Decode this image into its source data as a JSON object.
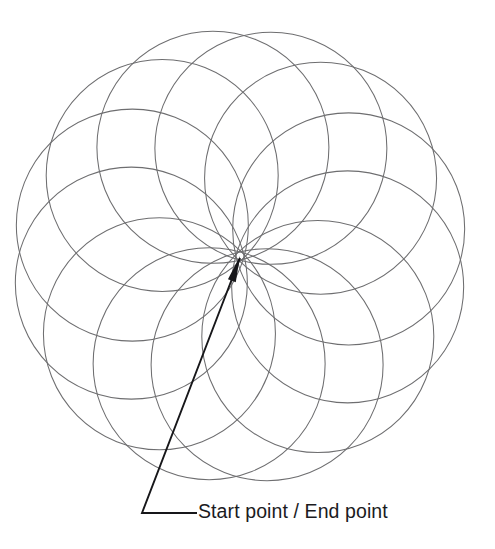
{
  "figure": {
    "background_color": "#ffffff",
    "width": 495,
    "height": 549
  },
  "annotation": {
    "label": "Start point / End point",
    "text_color": "#1b1b1e",
    "text_x": 198,
    "text_y": 513,
    "leader_color": "#17171a",
    "leader_points": "240,258 142,513 197,513",
    "arrow_tip_x": 240,
    "arrow_tip_y": 256
  },
  "chart_data": {
    "type": "scatter",
    "xlabel": "",
    "ylabel": "",
    "xlim": [
      0,
      495
    ],
    "ylim": [
      0,
      549
    ],
    "grid": false,
    "legend": "none",
    "common_point": {
      "x": 240,
      "y": 256,
      "label": "Start point / End point"
    },
    "circle_radius": 116,
    "center_orbit_radius": 112,
    "circle_count": 12,
    "start_angle_deg": -104,
    "angle_step_deg": 30,
    "stroke_color": "#6e6e70",
    "stroke_width": 1.05,
    "circles": [
      {
        "cx": 213.0,
        "cy": 147.3,
        "r": 116
      },
      {
        "cx": 252.0,
        "cy": 148.3,
        "r": 116
      },
      {
        "cx": 288.1,
        "cy": 163.0,
        "r": 116
      },
      {
        "cx": 317.6,
        "cy": 190.1,
        "r": 116
      },
      {
        "cx": 337.8,
        "cy": 226.0,
        "r": 116
      },
      {
        "cx": 346.8,
        "cy": 266.7,
        "r": 116
      },
      {
        "cx": 344.0,
        "cy": 308.2,
        "r": 116
      },
      {
        "cx": 329.7,
        "cy": 345.5,
        "r": 116
      },
      {
        "cx": 305.6,
        "cy": 375.2,
        "r": 116
      },
      {
        "cx": 274.6,
        "cy": 394.4,
        "r": 116
      },
      {
        "cx": 239.9,
        "cy": 401.4,
        "r": 116
      },
      {
        "cx": 205.3,
        "cy": 396.2,
        "r": 116
      },
      {
        "cx": 174.8,
        "cy": 379.0,
        "r": 116
      },
      {
        "cx": 151.4,
        "cy": 351.6,
        "r": 116
      },
      {
        "cx": 137.3,
        "cy": 316.7,
        "r": 116
      },
      {
        "cx": 134.0,
        "cy": 278.3,
        "r": 116
      },
      {
        "cx": 141.9,
        "cy": 240.4,
        "r": 116
      },
      {
        "cx": 160.5,
        "cy": 207.2,
        "r": 116
      },
      {
        "cx": 188.0,
        "cy": 181.8,
        "r": 116
      }
    ]
  }
}
